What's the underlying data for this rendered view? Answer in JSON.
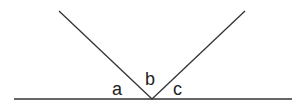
{
  "diagram": {
    "type": "angles-on-a-straight-line",
    "labels": {
      "a": "a",
      "b": "b",
      "c": "c"
    },
    "line_color": "#333333",
    "geometry": {
      "baseline": {
        "x1": 14,
        "y1": 99,
        "x2": 292,
        "y2": 99
      },
      "vertex": {
        "x": 152,
        "y": 99
      },
      "left_ray_end": {
        "x": 59,
        "y": 11
      },
      "right_ray_end": {
        "x": 245,
        "y": 11
      }
    }
  }
}
